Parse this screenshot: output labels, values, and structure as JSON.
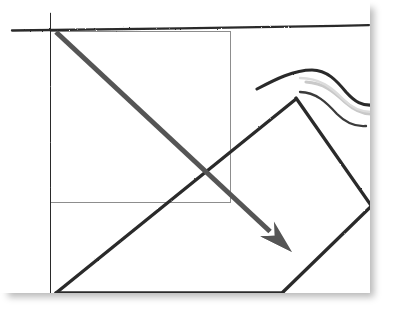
{
  "document": {
    "title": "Hand-drawn geometry sketch",
    "kind": "scanned-sketch",
    "caption": ""
  },
  "canvas": {
    "name": "paper",
    "background_color": "#ffffff",
    "width": 370,
    "height": 293,
    "shadow_color": "#b9b9b9"
  },
  "colors": {
    "ink_dark": "#2b2b2b",
    "ink_mid": "#555555",
    "ink_light": "#9a9a9a",
    "thin_rule": "#8d8d8d",
    "paper": "#ffffff",
    "shadow": "#b9b9b9"
  },
  "shapes": [
    {
      "id": "axis-vertical",
      "name": "vertical-axis-line",
      "type": "line",
      "style": "hand-drawn",
      "color": "#2b2b2b",
      "stroke_width": 2.6,
      "points": [
        [
          50,
          14
        ],
        [
          50.5,
          120
        ],
        [
          49.5,
          200
        ],
        [
          51,
          293
        ]
      ]
    },
    {
      "id": "axis-horizontal",
      "name": "horizontal-axis-line",
      "type": "line",
      "style": "hand-drawn",
      "color": "#2b2b2b",
      "stroke_width": 2.4,
      "points": [
        [
          12,
          30
        ],
        [
          90,
          29
        ],
        [
          180,
          28.5
        ],
        [
          260,
          27
        ],
        [
          330,
          26
        ],
        [
          369,
          25
        ]
      ]
    },
    {
      "id": "thin-rectangle",
      "name": "thin-reference-rectangle",
      "type": "rectangle",
      "style": "ruled-thin",
      "color": "#8d8d8d",
      "stroke_width": 1,
      "x": 50,
      "y": 31,
      "width": 180,
      "height": 171
    },
    {
      "id": "arrow-diagonal",
      "name": "diagonal-arrow",
      "type": "arrow",
      "style": "solid-tapered",
      "color": "#555555",
      "stroke_width": 5,
      "start": [
        56,
        32
      ],
      "end": [
        292,
        252
      ],
      "head": {
        "name": "arrow-head",
        "tip": [
          292,
          252
        ],
        "length": 34,
        "width": 20
      }
    },
    {
      "id": "rotated-square",
      "name": "rotated-square-outline",
      "type": "polygon",
      "style": "hand-drawn",
      "color": "#2b2b2b",
      "stroke_width": 3.2,
      "points": [
        [
          296,
          98
        ],
        [
          371,
          205
        ],
        [
          282,
          291
        ],
        [
          55,
          292
        ]
      ]
    },
    {
      "id": "wave-dark",
      "name": "wavy-s-curve-dark",
      "type": "path",
      "style": "hand-drawn-brush",
      "color": "#2b2b2b",
      "stroke_width": 3,
      "points": [
        [
          258,
          88
        ],
        [
          290,
          76
        ],
        [
          311,
          70
        ],
        [
          330,
          74
        ],
        [
          344,
          88
        ],
        [
          356,
          99
        ],
        [
          370,
          100
        ]
      ]
    },
    {
      "id": "wave-light",
      "name": "wavy-s-curve-light",
      "type": "path",
      "style": "hand-drawn-brush-faint",
      "color": "#c8c8c8",
      "stroke_width": 3,
      "points": [
        [
          310,
          83
        ],
        [
          330,
          86
        ],
        [
          344,
          98
        ],
        [
          358,
          110
        ],
        [
          370,
          112
        ]
      ]
    }
  ],
  "annotations": {
    "labels": [],
    "values": []
  }
}
